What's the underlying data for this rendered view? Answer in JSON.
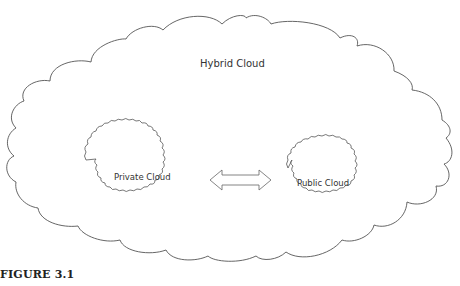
{
  "diagram": {
    "outer_cloud": {
      "label": "Hybrid Cloud"
    },
    "inner_clouds": [
      {
        "label": "Private Cloud"
      },
      {
        "label": "Public Cloud"
      }
    ],
    "connector": {
      "type": "double-headed-arrow",
      "direction": "bidirectional"
    },
    "stroke_color": "#555555",
    "fill_color": "#ffffff"
  },
  "caption": {
    "text": "FIGURE 3.1"
  }
}
